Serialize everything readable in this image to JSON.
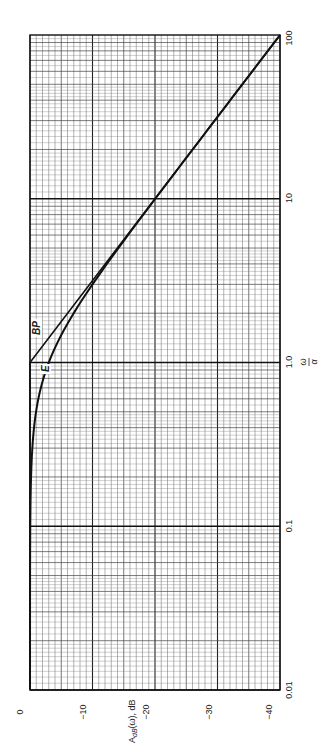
{
  "chart_data": {
    "type": "line",
    "title": "",
    "orientation_note": "figure rotated 90 degrees counter-clockwise",
    "xlabel": "ω/α",
    "ylabel": "A_dB(ω), dB",
    "x_scale": "log",
    "xlim": [
      0.01,
      100
    ],
    "ylim": [
      -40,
      0
    ],
    "x_ticks": [
      "0.01",
      "0.1",
      "1.0",
      "10",
      "100"
    ],
    "y_ticks": [
      "0",
      "−10",
      "−20",
      "−30",
      "−40"
    ],
    "grid": true,
    "series": [
      {
        "name": "BP",
        "description": "break-point (asymptotic) approximation",
        "x": [
          0.01,
          0.1,
          1.0,
          10,
          100
        ],
        "y": [
          0,
          0,
          0,
          -20,
          -40
        ]
      },
      {
        "name": "E",
        "description": "exact curve",
        "x": [
          0.01,
          0.1,
          0.2,
          0.5,
          1.0,
          2.0,
          5.0,
          10,
          100
        ],
        "y": [
          0,
          -0.04,
          -0.17,
          -0.97,
          -3.01,
          -6.99,
          -14.15,
          -20.04,
          -40
        ]
      }
    ],
    "annotations": [
      {
        "text": "BP",
        "near_x": 1.5,
        "near_y": -3
      },
      {
        "text": "E",
        "near_x": 0.8,
        "near_y": -3.5
      }
    ]
  },
  "labels": {
    "ylabel_main": "A",
    "ylabel_sub": "dB",
    "ylabel_rest": "(ω), dB",
    "xlabel_num": "ω",
    "xlabel_den": "α",
    "bp": "BP",
    "e": "E",
    "y_ticks": [
      "0",
      "−10",
      "−20",
      "−30",
      "−40"
    ],
    "x_ticks": [
      "0.01",
      "0.1",
      "1.0",
      "10",
      "100"
    ]
  }
}
